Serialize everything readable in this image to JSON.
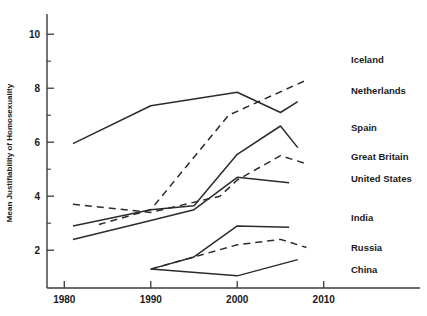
{
  "chart_data": {
    "type": "line",
    "title": "",
    "xlabel": "",
    "ylabel": "Mean Justifiability of Homosexuality",
    "xlim": [
      1978,
      2012
    ],
    "ylim": [
      0.6,
      10.6
    ],
    "xticks": [
      1980,
      1990,
      2000,
      2010
    ],
    "xtick_labels": [
      "1980",
      "1990",
      "2000",
      "2010"
    ],
    "yticks": [
      2,
      4,
      6,
      8,
      10
    ],
    "ytick_labels": [
      "2",
      "4",
      "6",
      "8",
      "10"
    ],
    "yminor_ticks": [
      3,
      5,
      7,
      9
    ],
    "grid": false,
    "legend_position": "right-inline",
    "series": [
      {
        "name": "Iceland",
        "style": "dashed",
        "x": [
          1984,
          1990,
          1999,
          2008
        ],
        "values": [
          2.95,
          3.5,
          7.0,
          8.3
        ]
      },
      {
        "name": "Netherlands",
        "style": "solid",
        "x": [
          1981,
          1990,
          2000,
          2005,
          2007
        ],
        "values": [
          5.95,
          7.35,
          7.85,
          7.1,
          7.5
        ]
      },
      {
        "name": "Spain",
        "style": "solid",
        "x": [
          1981,
          1990,
          1995,
          2000,
          2005,
          2007
        ],
        "values": [
          2.9,
          3.5,
          3.65,
          5.55,
          6.6,
          5.8
        ]
      },
      {
        "name": "Great Britain",
        "style": "dashed",
        "x": [
          1981,
          1990,
          1998,
          2000,
          2005,
          2008
        ],
        "values": [
          3.7,
          3.4,
          4.0,
          4.6,
          5.5,
          5.2
        ]
      },
      {
        "name": "United States",
        "style": "solid",
        "x": [
          1981,
          1990,
          1995,
          2000,
          2006
        ],
        "values": [
          2.4,
          3.1,
          3.5,
          4.7,
          4.5
        ]
      },
      {
        "name": "India",
        "style": "solid",
        "x": [
          1990,
          1995,
          2000,
          2006
        ],
        "values": [
          1.3,
          1.75,
          2.9,
          2.85
        ]
      },
      {
        "name": "Russia",
        "style": "dashed",
        "x": [
          1990,
          1995,
          2000,
          2005,
          2008
        ],
        "values": [
          1.3,
          1.75,
          2.2,
          2.4,
          2.1
        ]
      },
      {
        "name": "China",
        "style": "solid",
        "x": [
          1990,
          2000,
          2007
        ],
        "values": [
          1.3,
          1.05,
          1.65
        ]
      }
    ],
    "series_labels": [
      {
        "name": "Iceland",
        "label": "Iceland"
      },
      {
        "name": "Netherlands",
        "label": "Netherlands"
      },
      {
        "name": "Spain",
        "label": "Spain"
      },
      {
        "name": "Great Britain",
        "label": "Great Britain"
      },
      {
        "name": "United States",
        "label": "United States"
      },
      {
        "name": "India",
        "label": "India"
      },
      {
        "name": "Russia",
        "label": "Russia"
      },
      {
        "name": "China",
        "label": "China"
      }
    ],
    "colors": {
      "line": "#2b2b2b",
      "axis": "#3a3a3a",
      "text": "#1a1a1a",
      "background": "#ffffff"
    }
  }
}
